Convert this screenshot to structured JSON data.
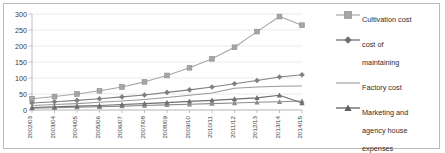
{
  "chart_data": {
    "type": "line",
    "title": "",
    "xlabel": "",
    "ylabel": "",
    "ylim": [
      0,
      300
    ],
    "yticks": [
      0,
      50,
      100,
      150,
      200,
      250,
      300
    ],
    "grid": true,
    "legend_position": "right",
    "categories": [
      "2002/03",
      "2003/04",
      "2004/05",
      "2005/06",
      "2006/07",
      "2007/08",
      "2008/09",
      "2009/10",
      "2010/11",
      "2011/12",
      "2012/13",
      "2013/14",
      "2014/15"
    ],
    "series": [
      {
        "name": "Cultivation cost",
        "marker": "square",
        "color": "#a6a6a6",
        "values": [
          35,
          42,
          50,
          60,
          72,
          88,
          108,
          132,
          160,
          196,
          245,
          292,
          265
        ]
      },
      {
        "name": "cost of maintaining",
        "marker": "diamond",
        "color": "#808080",
        "values": [
          22,
          26,
          30,
          35,
          41,
          47,
          55,
          63,
          72,
          82,
          92,
          103,
          110
        ]
      },
      {
        "name": "Factory cost",
        "marker": "none",
        "color": "#9a9a9a",
        "values": [
          14,
          17,
          20,
          24,
          28,
          33,
          39,
          46,
          53,
          68,
          72,
          74,
          75
        ]
      },
      {
        "name": "Marketing and agency house expenses",
        "marker": "triangle",
        "color": "#6e6e6e",
        "values": [
          8,
          10,
          12,
          14,
          17,
          20,
          23,
          27,
          30,
          34,
          38,
          46,
          22
        ]
      }
    ],
    "series_extra": [
      {
        "name": "secondary-lower-series",
        "marker": "triangle",
        "color": "#8c8c8c",
        "values": [
          6,
          7,
          9,
          10,
          12,
          14,
          16,
          18,
          20,
          22,
          24,
          26,
          28
        ]
      }
    ]
  },
  "legend": {
    "items": [
      {
        "label": "Cultivation cost",
        "marker": "square"
      },
      {
        "label": "cost of\nmaintaining",
        "marker": "diamond"
      },
      {
        "label": "Factory cost",
        "marker": "line"
      },
      {
        "label": "Marketing and\nagency house\nexpenses",
        "marker": "triangle"
      }
    ]
  }
}
